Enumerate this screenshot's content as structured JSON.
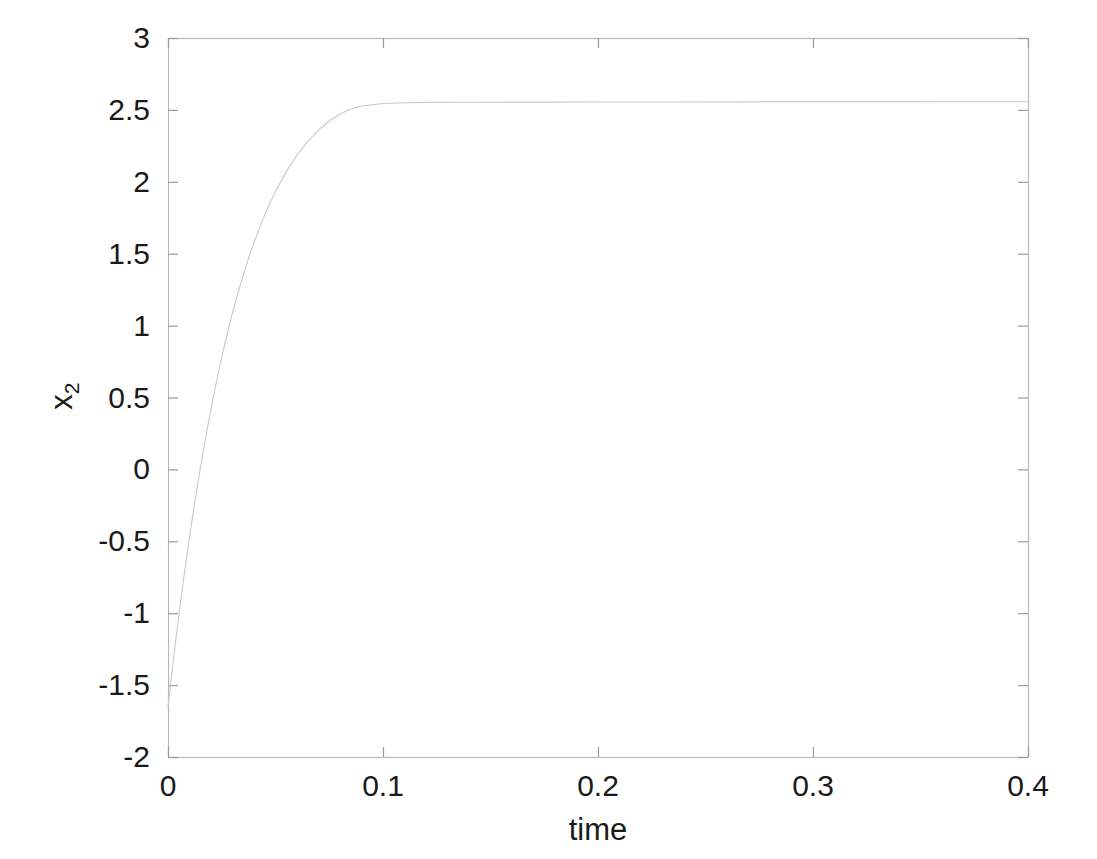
{
  "chart_data": {
    "type": "line",
    "title": "",
    "xlabel": "time",
    "ylabel": "x_2",
    "ylabel_base": "x",
    "ylabel_sub": "2",
    "xlim": [
      0,
      0.4
    ],
    "ylim": [
      -2,
      3
    ],
    "xticks": [
      0,
      0.1,
      0.2,
      0.3,
      0.4
    ],
    "xtick_labels": [
      "0",
      "0.1",
      "0.2",
      "0.3",
      "0.4"
    ],
    "yticks": [
      -2,
      -1.5,
      -1,
      -0.5,
      0,
      0.5,
      1,
      1.5,
      2,
      2.5,
      3
    ],
    "ytick_labels": [
      "-2",
      "-1.5",
      "-1",
      "-0.5",
      "0",
      "0.5",
      "1",
      "1.5",
      "2",
      "2.5",
      "3"
    ],
    "grid": false,
    "legend": null,
    "series": [
      {
        "name": "x2",
        "color": "#c9c9c9",
        "linewidth": 1.1,
        "x": [
          0.0,
          0.001,
          0.002,
          0.003,
          0.004,
          0.005,
          0.006,
          0.007,
          0.008,
          0.009,
          0.01,
          0.0115,
          0.013,
          0.0145,
          0.016,
          0.0175,
          0.019,
          0.0205,
          0.022,
          0.024,
          0.026,
          0.028,
          0.03,
          0.032,
          0.034,
          0.036,
          0.038,
          0.04,
          0.0425,
          0.045,
          0.0475,
          0.05,
          0.0525,
          0.055,
          0.0575,
          0.06,
          0.065,
          0.07,
          0.075,
          0.08,
          0.085,
          0.09,
          0.1,
          0.11,
          0.12,
          0.14,
          0.16,
          0.18,
          0.2,
          0.24,
          0.28,
          0.32,
          0.36,
          0.4
        ],
        "y": [
          -1.65,
          -1.52,
          -1.39,
          -1.262,
          -1.14,
          -1.02,
          -0.905,
          -0.792,
          -0.682,
          -0.575,
          -0.472,
          -0.322,
          -0.178,
          -0.04,
          0.092,
          0.22,
          0.342,
          0.459,
          0.571,
          0.712,
          0.845,
          0.97,
          1.088,
          1.198,
          1.302,
          1.4,
          1.492,
          1.578,
          1.678,
          1.77,
          1.854,
          1.932,
          2.003,
          2.069,
          2.129,
          2.185,
          2.281,
          2.36,
          2.423,
          2.472,
          2.506,
          2.527,
          2.545,
          2.55,
          2.552,
          2.553,
          2.554,
          2.554,
          2.555,
          2.555,
          2.556,
          2.556,
          2.557,
          2.557
        ]
      }
    ],
    "axes_box": {
      "left_px": 168,
      "right_px": 1028,
      "top_px": 38,
      "bottom_px": 757,
      "frame_color": "#b8b8b8",
      "tick_color": "#9a9a9a"
    }
  }
}
